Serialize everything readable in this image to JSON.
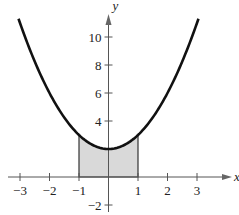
{
  "chart_data": {
    "type": "line",
    "title": "",
    "xlabel": "x",
    "ylabel": "y",
    "function": "y = x^2 + 2",
    "xlim": [
      -3.5,
      4
    ],
    "ylim": [
      -2.5,
      12
    ],
    "grid": false,
    "x_ticks": [
      -3,
      -2,
      -1,
      1,
      2,
      3
    ],
    "x_tick_labels": [
      "−3",
      "−2",
      "−1",
      "1",
      "2",
      "3"
    ],
    "y_ticks": [
      -2,
      4,
      6,
      8,
      10
    ],
    "y_tick_labels": [
      "−2",
      "4",
      "6",
      "8",
      "10"
    ],
    "series": [
      {
        "name": "curve",
        "x": [
          -3,
          -2,
          -1,
          0,
          1,
          2,
          3
        ],
        "y": [
          11,
          6,
          3,
          2,
          3,
          6,
          11
        ]
      }
    ],
    "shaded_region": {
      "x_from": -1,
      "x_to": 1,
      "between": [
        "x-axis",
        "curve"
      ],
      "color": "#d9d9d9"
    }
  }
}
